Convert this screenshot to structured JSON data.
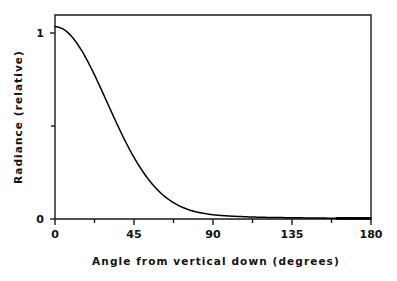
{
  "chart_data": {
    "type": "line",
    "title": "",
    "subtitle": "",
    "xlabel": "Angle  from  vertical  down  (degrees)",
    "ylabel": "Radiance  (relative)",
    "xlim": [
      0,
      180
    ],
    "ylim": [
      0,
      1.06
    ],
    "grid": false,
    "legend": null,
    "x_ticks": [
      0,
      45,
      90,
      135,
      180
    ],
    "x_tick_labels": [
      "0",
      "45",
      "90",
      "135",
      "180"
    ],
    "x_minor_ticks": [
      22.5,
      67.5,
      112.5,
      157.5
    ],
    "y_ticks": [
      0,
      1
    ],
    "y_tick_labels": [
      "0",
      "1"
    ],
    "y_minor_ticks": [
      0.5
    ],
    "series": [
      {
        "name": "Radiance",
        "color": "#000000",
        "x": [
          0,
          5,
          10,
          15,
          20,
          25,
          30,
          35,
          40,
          45,
          50,
          55,
          60,
          65,
          70,
          75,
          80,
          85,
          90,
          95,
          100,
          105,
          110,
          115,
          120,
          125,
          130,
          135,
          140,
          145,
          150,
          155,
          160,
          165,
          170,
          175,
          180
        ],
        "values": [
          1.0,
          0.985,
          0.943,
          0.878,
          0.795,
          0.7,
          0.6,
          0.5,
          0.405,
          0.32,
          0.247,
          0.186,
          0.137,
          0.1,
          0.072,
          0.052,
          0.038,
          0.029,
          0.022,
          0.018,
          0.015,
          0.013,
          0.011,
          0.0095,
          0.0085,
          0.0078,
          0.0072,
          0.0066,
          0.006,
          0.0055,
          0.005,
          0.0045,
          0.004,
          0.0035,
          0.003,
          0.0025,
          0.002
        ]
      }
    ],
    "annotations": []
  },
  "axes": {
    "x_title": "Angle  from  vertical  down  (degrees)",
    "y_title": "Radiance  (relative)",
    "x_tick_labels": [
      "0",
      "45",
      "90",
      "135",
      "180"
    ],
    "y_tick_labels": [
      "1",
      "0"
    ]
  },
  "colors": {
    "background": "#ffffff",
    "frame": "#1a1a1a",
    "curve": "#000000",
    "text": "#111111"
  }
}
